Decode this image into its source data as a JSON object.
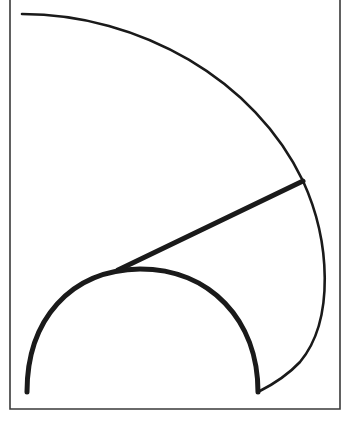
{
  "figure": {
    "frame": {
      "left": 10,
      "right": 340,
      "bottom": 409,
      "stroke": "#333333"
    },
    "colors": {
      "ink": "#1a1a1a",
      "background": "#ffffff"
    },
    "shapes": {
      "outer_arc": {
        "start": [
          22,
          14
        ],
        "via": [
          303,
          181
        ],
        "rightmost": [
          325,
          270
        ],
        "end": [
          258,
          392
        ],
        "stroke_width": 2.5
      },
      "tangent_line": {
        "start": [
          303,
          181
        ],
        "end": [
          118,
          270
        ],
        "stroke_width": 5
      },
      "inner_arc": {
        "start": [
          27,
          392
        ],
        "top": [
          140,
          269
        ],
        "end": [
          258,
          392
        ],
        "stroke_width": 5
      }
    }
  }
}
